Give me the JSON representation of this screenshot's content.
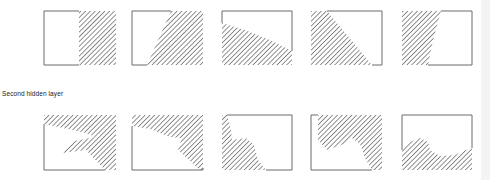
{
  "figure": {
    "row_label": "Second hidden layer",
    "colors": {
      "frame": "#6a6a6a",
      "hatch": "#555555",
      "background": "#ffffff"
    },
    "rows": [
      {
        "name": "first-row",
        "panels": [
          {
            "id": 1,
            "region": "right-half"
          },
          {
            "id": 2,
            "region": "right-diagonal"
          },
          {
            "id": 3,
            "region": "bottom-wedge"
          },
          {
            "id": 4,
            "region": "left-triangle"
          },
          {
            "id": 5,
            "region": "left-trapezoid"
          }
        ]
      },
      {
        "name": "second-hidden-layer",
        "panels": [
          {
            "id": 6,
            "region": "top-right-notched"
          },
          {
            "id": 7,
            "region": "top-band-right-lobe"
          },
          {
            "id": 8,
            "region": "left-blob-bottom"
          },
          {
            "id": 9,
            "region": "top-right-blob"
          },
          {
            "id": 10,
            "region": "bottom-wave"
          }
        ]
      }
    ]
  }
}
